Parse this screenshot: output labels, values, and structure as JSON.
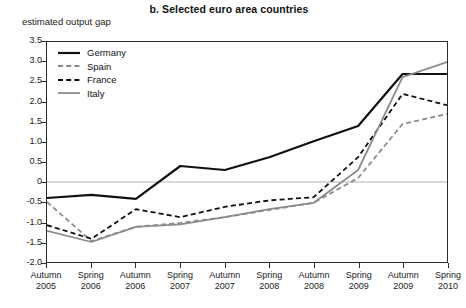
{
  "title": "b.  Selected euro area countries",
  "axis_note": "estimated output gap",
  "colors": {
    "germany": "#111111",
    "spain": "#8c8c8c",
    "france": "#111111",
    "italy": "#8c8c8c",
    "frame": "#2b2b2b",
    "zeroline": "#b3b3b3",
    "background": "#ffffff"
  },
  "legend": {
    "position": "top-left-inside",
    "items": [
      {
        "label": "Germany",
        "style": "solid",
        "color": "#111111",
        "width": 2.2
      },
      {
        "label": "Spain",
        "style": "dashed",
        "color": "#8c8c8c",
        "width": 1.8
      },
      {
        "label": "France",
        "style": "dashed",
        "color": "#111111",
        "width": 1.8
      },
      {
        "label": "Italy",
        "style": "solid",
        "color": "#8c8c8c",
        "width": 1.8
      }
    ]
  },
  "yaxis": {
    "label": "estimated output gap",
    "min": -2.0,
    "max": 3.5,
    "step": 0.5,
    "ticks": [
      "3.5",
      "3.0",
      "2.5",
      "2.0",
      "1.5",
      "1.0",
      "0.5",
      "0",
      "-0.5",
      "-1.0",
      "-1.5",
      "-2.0"
    ],
    "tick_values": [
      3.5,
      3.0,
      2.5,
      2.0,
      1.5,
      1.0,
      0.5,
      0,
      -0.5,
      -1.0,
      -1.5,
      -2.0
    ]
  },
  "xaxis": {
    "categories": [
      {
        "season": "Autumn",
        "year": "2005"
      },
      {
        "season": "Spring",
        "year": "2006"
      },
      {
        "season": "Autumn",
        "year": "2006"
      },
      {
        "season": "Spring",
        "year": "2007"
      },
      {
        "season": "Autumn",
        "year": "2007"
      },
      {
        "season": "Spring",
        "year": "2008"
      },
      {
        "season": "Autumn",
        "year": "2008"
      },
      {
        "season": "Spring",
        "year": "2009"
      },
      {
        "season": "Autumn",
        "year": "2009"
      },
      {
        "season": "Spring",
        "year": "2010"
      }
    ]
  },
  "chart_data": {
    "type": "line",
    "title": "b.  Selected euro area countries",
    "subtitle": "",
    "xlabel": "",
    "ylabel": "estimated output gap",
    "ylim": [
      -2.0,
      3.5
    ],
    "ytick_step": 0.5,
    "grid": "zero-line-only",
    "legend_position": "top-left-inside",
    "categories": [
      "Autumn 2005",
      "Spring 2006",
      "Autumn 2006",
      "Spring 2007",
      "Autumn 2007",
      "Spring 2008",
      "Autumn 2008",
      "Spring 2009",
      "Autumn 2009",
      "Spring 2010"
    ],
    "series": [
      {
        "name": "Germany",
        "color": "#111111",
        "style": "solid",
        "values": [
          -0.4,
          -0.32,
          -0.42,
          0.4,
          0.3,
          0.62,
          1.02,
          1.4,
          2.7,
          2.7
        ]
      },
      {
        "name": "Spain",
        "color": "#8c8c8c",
        "style": "dashed",
        "values": [
          -0.5,
          -1.48,
          -1.12,
          -1.02,
          -0.88,
          -0.7,
          -0.52,
          0.1,
          1.45,
          1.7
        ]
      },
      {
        "name": "France",
        "color": "#111111",
        "style": "dashed",
        "values": [
          -1.08,
          -1.42,
          -0.68,
          -0.88,
          -0.62,
          -0.46,
          -0.38,
          0.62,
          2.2,
          1.92
        ]
      },
      {
        "name": "Italy",
        "color": "#8c8c8c",
        "style": "solid",
        "values": [
          -1.22,
          -1.5,
          -1.12,
          -1.06,
          -0.88,
          -0.68,
          -0.52,
          0.3,
          2.62,
          3.0
        ]
      }
    ],
    "annotations": []
  }
}
